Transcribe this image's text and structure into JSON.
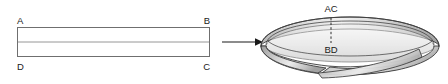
{
  "figure": {
    "caption": "",
    "background_color": "#ffffff"
  },
  "flat_strip": {
    "name": "flat rectangular strip",
    "corner_labels": {
      "top_left": "A",
      "top_right": "B",
      "bottom_right": "C",
      "bottom_left": "D"
    },
    "outline_color": "#6f6f6f",
    "divider_color": "#8a8a8a",
    "fill_color": "#ffffff",
    "geometry": {
      "x": 17,
      "y": 27,
      "width": 193,
      "height": 30,
      "divider_y": 42
    }
  },
  "transform_arrow": {
    "name": "transformation arrow",
    "direction": "right",
    "color": "#1a1a1a",
    "geometry": {
      "x1": 222,
      "x2": 262,
      "y": 42
    }
  },
  "mobius_band": {
    "name": "mobius band",
    "seam_labels": {
      "top": "AC",
      "bottom": "BD"
    },
    "seam_line_style": "dashed",
    "edge_color": "#3c3c3c",
    "shading": {
      "light": "#fdfdfd",
      "mid": "#d9d9d9",
      "dark": "#a8a8a8"
    },
    "geometry": {
      "center_x": 350,
      "center_y": 48,
      "radius_x": 90,
      "radius_y": 26,
      "band_height": 22,
      "seam_x": 331,
      "seam_top_y": 18,
      "seam_bottom_y": 43
    }
  }
}
